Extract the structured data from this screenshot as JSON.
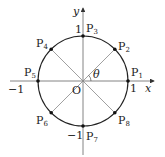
{
  "diagram": {
    "type": "unit-circle",
    "center_label": "O",
    "axes": {
      "x_label": "x",
      "y_label": "y"
    },
    "ticks": {
      "x_pos": "1",
      "x_neg": "−1",
      "y_pos": "1",
      "y_neg": "−1"
    },
    "angle_label": "θ",
    "points": [
      {
        "name": "P",
        "sub": "1",
        "angle_deg": 0
      },
      {
        "name": "P",
        "sub": "2",
        "angle_deg": 45
      },
      {
        "name": "P",
        "sub": "3",
        "angle_deg": 90
      },
      {
        "name": "P",
        "sub": "4",
        "angle_deg": 135
      },
      {
        "name": "P",
        "sub": "5",
        "angle_deg": 180
      },
      {
        "name": "P",
        "sub": "6",
        "angle_deg": 225
      },
      {
        "name": "P",
        "sub": "7",
        "angle_deg": 270
      },
      {
        "name": "P",
        "sub": "8",
        "angle_deg": 315
      }
    ],
    "colors": {
      "stroke": "#222222",
      "axis": "#555555",
      "radius_line": "#777777"
    }
  }
}
